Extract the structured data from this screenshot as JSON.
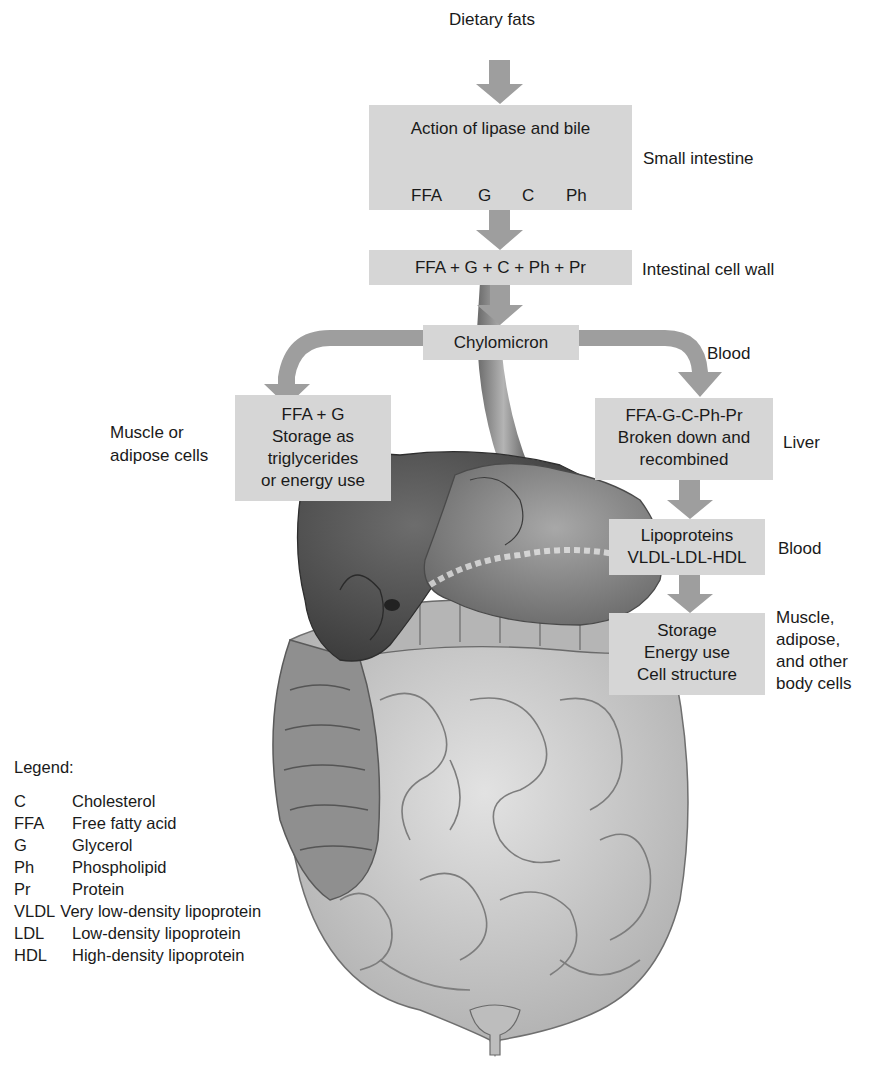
{
  "diagram": {
    "title": "Dietary fats",
    "colors": {
      "box_fill": "#d6d6d6",
      "arrow_fill": "#9e9e9e",
      "text": "#1a1a1a",
      "organ_dark": "#5a5a5a",
      "organ_light": "#c9c9c9"
    },
    "nodes": {
      "small_intestine": {
        "heading": "Action of lipase and bile",
        "components": [
          "FFA",
          "G",
          "C",
          "Ph"
        ],
        "side_label": "Small intestine"
      },
      "intestinal_cell_wall": {
        "text": "FFA + G + C + Ph + Pr",
        "side_label": "Intestinal cell wall"
      },
      "chylomicron": {
        "text": "Chylomicron",
        "side_label": "Blood"
      },
      "muscle_adipose": {
        "lines": [
          "FFA + G",
          "Storage as",
          "triglycerides",
          "or energy use"
        ],
        "side_label_lines": [
          "Muscle or",
          "adipose cells"
        ]
      },
      "liver": {
        "lines": [
          "FFA-G-C-Ph-Pr",
          "Broken down and",
          "recombined"
        ],
        "side_label": "Liver"
      },
      "lipoproteins": {
        "lines": [
          "Lipoproteins",
          "VLDL-LDL-HDL"
        ],
        "side_label": "Blood"
      },
      "body_cells": {
        "lines": [
          "Storage",
          "Energy use",
          "Cell structure"
        ],
        "side_label_lines": [
          "Muscle,",
          "adipose,",
          "and other",
          "body cells"
        ]
      }
    },
    "legend": {
      "title": "Legend:",
      "items": [
        {
          "abbr": "C",
          "meaning": "Cholesterol"
        },
        {
          "abbr": "FFA",
          "meaning": "Free fatty acid"
        },
        {
          "abbr": "G",
          "meaning": "Glycerol"
        },
        {
          "abbr": "Ph",
          "meaning": "Phospholipid"
        },
        {
          "abbr": "Pr",
          "meaning": "Protein"
        },
        {
          "abbr": "VLDL",
          "meaning": "Very low-density lipoprotein"
        },
        {
          "abbr": "LDL",
          "meaning": "Low-density lipoprotein"
        },
        {
          "abbr": "HDL",
          "meaning": "High-density lipoprotein"
        }
      ]
    },
    "illustration": "digestive-system-anatomy"
  }
}
